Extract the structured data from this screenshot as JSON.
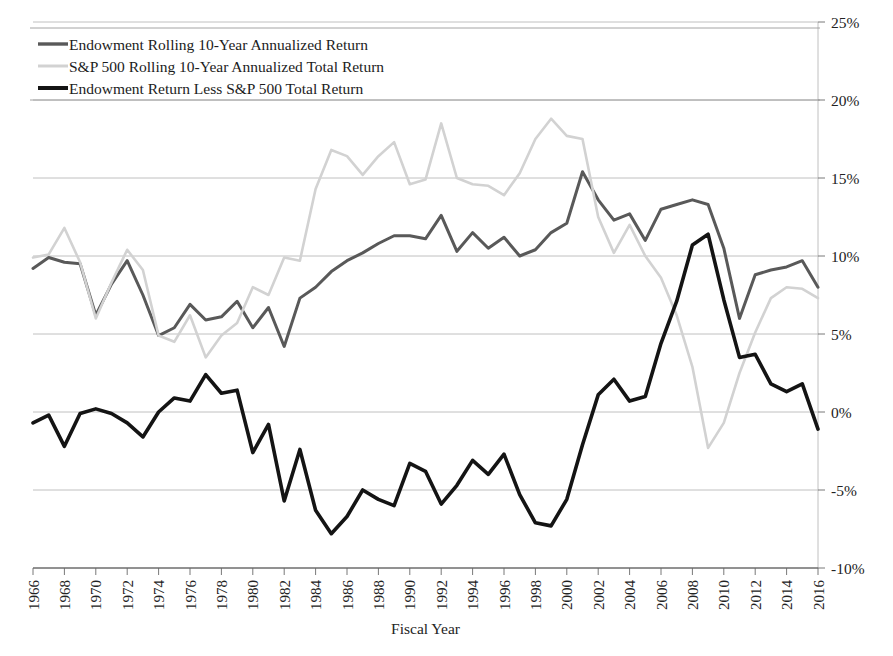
{
  "figure": {
    "axis_title_x": "Fiscal Year",
    "background": "#ffffff"
  },
  "legend": {
    "items": [
      {
        "label": "Endowment Rolling 10-Year Annualized Return",
        "color": "#595959",
        "width": 3.4
      },
      {
        "label": "S&P 500 Rolling 10-Year Annualized Total Return",
        "color": "#d2d2d2",
        "width": 3.0
      },
      {
        "label": "Endowment Return Less S&P 500 Total Return",
        "color": "#141414",
        "width": 4.0
      }
    ]
  },
  "chart_data": {
    "type": "line",
    "title": "",
    "xlabel": "Fiscal Year",
    "ylabel": "",
    "xlim": [
      1966,
      2016
    ],
    "ylim": [
      -10,
      25
    ],
    "ytick_labels": [
      "25%",
      "20%",
      "15%",
      "10%",
      "5%",
      "0%",
      "-5%",
      "-10%"
    ],
    "ytick_values": [
      25,
      20,
      15,
      10,
      5,
      0,
      -5,
      -10
    ],
    "xtick_labels": [
      "1966",
      "1968",
      "1970",
      "1972",
      "1974",
      "1976",
      "1978",
      "1980",
      "1982",
      "1984",
      "1986",
      "1988",
      "1990",
      "1992",
      "1994",
      "1996",
      "1998",
      "2000",
      "2002",
      "2004",
      "2006",
      "2008",
      "2010",
      "2012",
      "2014",
      "2016"
    ],
    "xtick_values": [
      1966,
      1968,
      1970,
      1972,
      1974,
      1976,
      1978,
      1980,
      1982,
      1984,
      1986,
      1988,
      1990,
      1992,
      1994,
      1996,
      1998,
      2000,
      2002,
      2004,
      2006,
      2008,
      2010,
      2012,
      2014,
      2016
    ],
    "grid": true,
    "legend_position": "top-left",
    "x": [
      1966,
      1967,
      1968,
      1969,
      1970,
      1971,
      1972,
      1973,
      1974,
      1975,
      1976,
      1977,
      1978,
      1979,
      1980,
      1981,
      1982,
      1983,
      1984,
      1985,
      1986,
      1987,
      1988,
      1989,
      1990,
      1991,
      1992,
      1993,
      1994,
      1995,
      1996,
      1997,
      1998,
      1999,
      2000,
      2001,
      2002,
      2003,
      2004,
      2005,
      2006,
      2007,
      2008,
      2009,
      2010,
      2011,
      2012,
      2013,
      2014,
      2015,
      2016
    ],
    "series": [
      {
        "name": "Endowment Rolling 10-Year Annualized Return",
        "color": "#595959",
        "values": [
          9.2,
          9.9,
          9.6,
          9.5,
          6.2,
          8.2,
          9.7,
          7.5,
          4.9,
          5.4,
          6.9,
          5.9,
          6.1,
          7.1,
          5.4,
          6.7,
          4.2,
          7.3,
          8.0,
          9.0,
          9.7,
          10.2,
          10.8,
          11.3,
          11.3,
          11.1,
          12.6,
          10.3,
          11.5,
          10.5,
          11.2,
          10.0,
          10.4,
          11.5,
          12.1,
          15.4,
          13.6,
          12.3,
          12.7,
          11.0,
          13.0,
          13.3,
          13.6,
          13.3,
          10.5,
          6.0,
          8.8,
          9.1,
          9.3,
          9.7,
          8.0
        ]
      },
      {
        "name": "S&P 500 Rolling 10-Year Annualized Total Return",
        "color": "#d2d2d2",
        "values": [
          9.9,
          10.1,
          11.8,
          9.6,
          6.0,
          8.3,
          10.4,
          9.1,
          4.9,
          4.5,
          6.2,
          3.5,
          4.9,
          5.7,
          8.0,
          7.5,
          9.9,
          9.7,
          14.3,
          16.8,
          16.4,
          15.2,
          16.4,
          17.3,
          14.6,
          14.9,
          18.5,
          15.0,
          14.6,
          14.5,
          13.9,
          15.3,
          17.5,
          18.8,
          17.7,
          17.5,
          12.5,
          10.2,
          12.0,
          10.0,
          8.6,
          6.2,
          2.9,
          -2.3,
          -0.7,
          2.5,
          5.1,
          7.3,
          8.0,
          7.9,
          7.3
        ]
      },
      {
        "name": "Endowment Return Less S&P 500 Total Return",
        "color": "#141414",
        "values": [
          -0.7,
          -0.2,
          -2.2,
          -0.1,
          0.2,
          -0.1,
          -0.7,
          -1.6,
          0.0,
          0.9,
          0.7,
          2.4,
          1.2,
          1.4,
          -2.6,
          -0.8,
          -5.7,
          -2.4,
          -6.3,
          -7.8,
          -6.7,
          -5.0,
          -5.6,
          -6.0,
          -3.3,
          -3.8,
          -5.9,
          -4.7,
          -3.1,
          -4.0,
          -2.7,
          -5.3,
          -7.1,
          -7.3,
          -5.6,
          -2.1,
          1.1,
          2.1,
          0.7,
          1.0,
          4.4,
          7.1,
          10.7,
          11.4,
          7.2,
          3.5,
          3.7,
          1.8,
          1.3,
          1.8,
          -1.1
        ]
      }
    ]
  }
}
